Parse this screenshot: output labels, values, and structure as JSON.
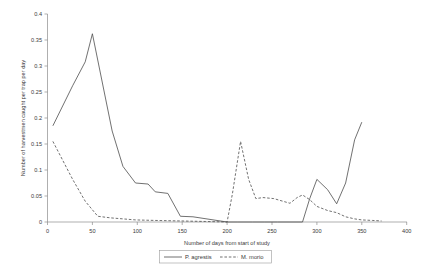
{
  "chart_data": {
    "type": "line",
    "title": "",
    "xlabel": "Number of days from start of study",
    "ylabel": "Number of harvestmen caught per trap per day",
    "xlim": [
      0,
      400
    ],
    "ylim": [
      0,
      0.4
    ],
    "xticks": [
      0,
      50,
      100,
      150,
      200,
      250,
      300,
      350,
      400
    ],
    "xtick_labels": [
      "0",
      "50",
      "100",
      "150",
      "200",
      "250",
      "300",
      "350",
      "400"
    ],
    "yticks": [
      0,
      0.05,
      0.1,
      0.15,
      0.2,
      0.25,
      0.3,
      0.35,
      0.4
    ],
    "ytick_labels": [
      "0",
      "0.05",
      "0.1",
      "0.15",
      "0.2",
      "0.25",
      "0.3",
      "0.35",
      "0.4"
    ],
    "grid": false,
    "legend_position": "bottom-center",
    "series": [
      {
        "name": "P. agrestis",
        "style": "solid",
        "color": "#4d4d4d",
        "x": [
          6,
          28,
          42,
          50,
          72,
          84,
          98,
          112,
          120,
          134,
          148,
          162,
          200,
          212,
          228,
          242,
          256,
          270,
          284,
          292,
          300,
          312,
          322,
          332,
          342,
          350
        ],
        "y": [
          0.185,
          0.262,
          0.308,
          0.362,
          0.175,
          0.107,
          0.075,
          0.073,
          0.058,
          0.055,
          0.011,
          0.01,
          0.0,
          0.0,
          0.0,
          0.0,
          0.0,
          0.0,
          0.0,
          0.045,
          0.082,
          0.062,
          0.035,
          0.075,
          0.158,
          0.192
        ]
      },
      {
        "name": "M. morio",
        "style": "dashed",
        "color": "#4d4d4d",
        "x": [
          6,
          28,
          42,
          56,
          70,
          84,
          98,
          120,
          148,
          176,
          200,
          206,
          215,
          224,
          232,
          240,
          252,
          262,
          270,
          278,
          284,
          292,
          300,
          312,
          322,
          332,
          342,
          350,
          362,
          372
        ],
        "y": [
          0.155,
          0.082,
          0.04,
          0.011,
          0.008,
          0.006,
          0.004,
          0.003,
          0.002,
          0.001,
          0.0,
          0.055,
          0.155,
          0.082,
          0.045,
          0.047,
          0.045,
          0.04,
          0.036,
          0.047,
          0.052,
          0.043,
          0.03,
          0.022,
          0.018,
          0.01,
          0.006,
          0.004,
          0.003,
          0.002
        ]
      }
    ]
  },
  "legend": {
    "entries": [
      {
        "label": "P. agrestis",
        "style": "solid"
      },
      {
        "label": "M. morio",
        "style": "dashed"
      }
    ]
  }
}
